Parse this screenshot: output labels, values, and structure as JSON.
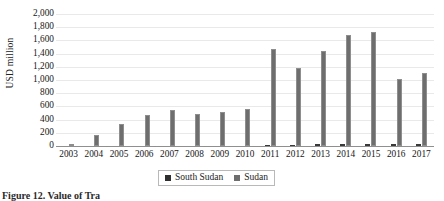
{
  "figure": {
    "caption": "Figure 12. Value of Tra",
    "y_axis_title": "USD million"
  },
  "legend": {
    "position": "bottom-center",
    "items": [
      {
        "label": "South Sudan",
        "color": "#2e2e2e"
      },
      {
        "label": "Sudan",
        "color": "#6e6e6e"
      }
    ]
  },
  "chart_data": {
    "type": "bar",
    "title": "",
    "subtitle": "",
    "xlabel": "",
    "ylabel": "USD million",
    "ylim": [
      0,
      2000
    ],
    "ytick_labels": [
      "0",
      "200",
      "400",
      "600",
      "800",
      "1,000",
      "1,200",
      "1,400",
      "1,600",
      "1,800",
      "2,000"
    ],
    "ytick_values": [
      0,
      200,
      400,
      600,
      800,
      1000,
      1200,
      1400,
      1600,
      1800,
      2000
    ],
    "grid": true,
    "grid_axis": "y",
    "categories": [
      "2003",
      "2004",
      "2005",
      "2006",
      "2007",
      "2008",
      "2009",
      "2010",
      "2011",
      "2012",
      "2013",
      "2014",
      "2015",
      "2016",
      "2017"
    ],
    "series": [
      {
        "name": "South Sudan",
        "color": "#2e2e2e",
        "values": [
          0,
          0,
          0,
          0,
          0,
          0,
          0,
          0,
          5,
          20,
          30,
          25,
          25,
          30,
          30
        ]
      },
      {
        "name": "Sudan",
        "color": "#6e6e6e",
        "values": [
          0,
          160,
          330,
          470,
          545,
          490,
          520,
          560,
          1470,
          1175,
          1440,
          1675,
          1730,
          1020,
          1105
        ]
      }
    ]
  }
}
